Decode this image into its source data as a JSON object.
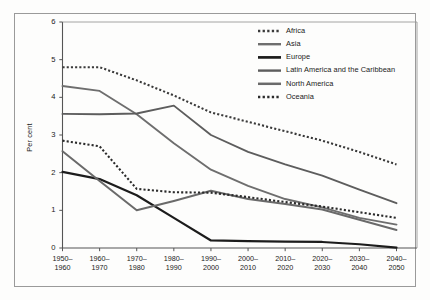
{
  "chart_data": {
    "type": "line",
    "title": "",
    "xlabel": "",
    "ylabel": "Per cent",
    "ylim": [
      0,
      6
    ],
    "yticks": [
      0,
      1,
      2,
      3,
      4,
      5,
      6
    ],
    "ytick_labels": [
      "0",
      "1",
      "2",
      "3",
      "4",
      "5",
      "6"
    ],
    "grid": false,
    "legend_position": "top-right",
    "categories": [
      "1950–1960",
      "1960–1970",
      "1970–1980",
      "1980–1990",
      "1990–2000",
      "2000–2010",
      "2010–2020",
      "2020–2030",
      "2030–2040",
      "2040–2050"
    ],
    "category_lines": [
      [
        "1950–",
        "1960"
      ],
      [
        "1960–",
        "1970"
      ],
      [
        "1970–",
        "1980"
      ],
      [
        "1980–",
        "1990"
      ],
      [
        "1990–",
        "2000"
      ],
      [
        "2000–",
        "2010"
      ],
      [
        "2010–",
        "2020"
      ],
      [
        "2020–",
        "2030"
      ],
      [
        "2030–",
        "2040"
      ],
      [
        "2040–",
        "2050"
      ]
    ],
    "series": [
      {
        "name": "Africa",
        "style": "dotted",
        "color": "#3a3a3a",
        "width": 2.1,
        "values": [
          4.8,
          4.8,
          4.45,
          4.05,
          3.6,
          3.35,
          3.1,
          2.85,
          2.55,
          2.22
        ]
      },
      {
        "name": "Asia",
        "style": "solid",
        "color": "#6e6e6e",
        "width": 1.9,
        "values": [
          4.3,
          4.17,
          3.55,
          2.78,
          2.08,
          1.65,
          1.3,
          1.08,
          0.8,
          0.62
        ]
      },
      {
        "name": "Europe",
        "style": "solid",
        "color": "#1c1c1c",
        "width": 2.2,
        "values": [
          2.02,
          1.83,
          1.4,
          0.8,
          0.2,
          0.18,
          0.17,
          0.16,
          0.1,
          0.01
        ]
      },
      {
        "name": "Latin America and the Caribbean",
        "style": "solid",
        "color": "#5d5d5d",
        "width": 1.9,
        "values": [
          3.56,
          3.55,
          3.57,
          3.78,
          3.0,
          2.55,
          2.22,
          1.92,
          1.55,
          1.19
        ]
      },
      {
        "name": "North America",
        "style": "solid",
        "color": "#6a6a6a",
        "width": 2.0,
        "values": [
          2.57,
          1.78,
          1.0,
          1.25,
          1.52,
          1.3,
          1.17,
          1.02,
          0.75,
          0.48
        ]
      },
      {
        "name": "Oceania",
        "style": "dotted",
        "color": "#2b2b2b",
        "width": 2.1,
        "values": [
          2.85,
          2.7,
          1.57,
          1.48,
          1.47,
          1.35,
          1.22,
          1.1,
          0.95,
          0.8
        ]
      }
    ]
  },
  "legend": {
    "entries": [
      {
        "label": "Africa"
      },
      {
        "label": "Asia"
      },
      {
        "label": "Europe"
      },
      {
        "label": "Latin America and the Caribbean"
      },
      {
        "label": "North America"
      },
      {
        "label": "Oceania"
      }
    ]
  },
  "watermark": {
    "line1": "THE UNIVERSITY",
    "line2": "OF",
    "line3": "URBANIZATION AND"
  }
}
